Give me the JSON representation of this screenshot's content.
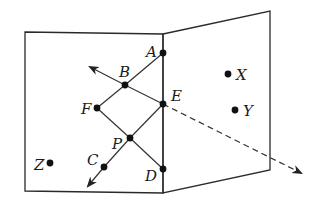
{
  "diagram": {
    "type": "geometry-planes",
    "colors": {
      "stroke": "#2a2a2a",
      "point": "#111111",
      "background": "#ffffff"
    },
    "planes": [
      {
        "name": "left-plane",
        "corners": [
          [
            25,
            32
          ],
          [
            163,
            34
          ],
          [
            163,
            193
          ],
          [
            25,
            191
          ]
        ]
      },
      {
        "name": "right-plane",
        "corners": [
          [
            163,
            34
          ],
          [
            270,
            11
          ],
          [
            270,
            170
          ],
          [
            163,
            193
          ]
        ]
      }
    ],
    "points": [
      {
        "id": "A",
        "label": "A",
        "x": 163,
        "y": 53,
        "lx": 146,
        "ly": 57
      },
      {
        "id": "B",
        "label": "B",
        "x": 125,
        "y": 85,
        "lx": 119,
        "ly": 77
      },
      {
        "id": "E",
        "label": "E",
        "x": 163,
        "y": 104,
        "lx": 171,
        "ly": 101
      },
      {
        "id": "F",
        "label": "F",
        "x": 97,
        "y": 108,
        "lx": 81,
        "ly": 114
      },
      {
        "id": "P",
        "label": "P",
        "x": 130,
        "y": 138,
        "lx": 112,
        "ly": 149
      },
      {
        "id": "C",
        "label": "C",
        "x": 104,
        "y": 167,
        "lx": 87,
        "ly": 165
      },
      {
        "id": "D",
        "label": "D",
        "x": 163,
        "y": 169,
        "lx": 145,
        "ly": 181
      },
      {
        "id": "X",
        "label": "X",
        "x": 228,
        "y": 74,
        "lx": 236,
        "ly": 80
      },
      {
        "id": "Y",
        "label": "Y",
        "x": 235,
        "y": 110,
        "lx": 243,
        "ly": 116
      },
      {
        "id": "Z",
        "label": "Z",
        "x": 50,
        "y": 163,
        "lx": 34,
        "ly": 170
      }
    ],
    "segments": [
      {
        "from": "A",
        "to": "B"
      },
      {
        "from": "B",
        "to": "E"
      },
      {
        "from": "B",
        "to": "F"
      },
      {
        "from": "F",
        "to": "P"
      },
      {
        "from": "P",
        "to": "D"
      },
      {
        "from": "E",
        "to": "P"
      },
      {
        "from": "P",
        "to": "C"
      }
    ],
    "rays": [
      {
        "name": "ray-E-B",
        "from": [
          125,
          85
        ],
        "to": [
          90,
          67
        ],
        "style": "solid"
      },
      {
        "name": "ray-P-C",
        "from": [
          104,
          167
        ],
        "to": [
          88,
          186
        ],
        "style": "solid"
      },
      {
        "name": "ray-B-E-extended",
        "from": [
          163,
          104
        ],
        "to": [
          301,
          173
        ],
        "style": "dashed"
      }
    ]
  }
}
